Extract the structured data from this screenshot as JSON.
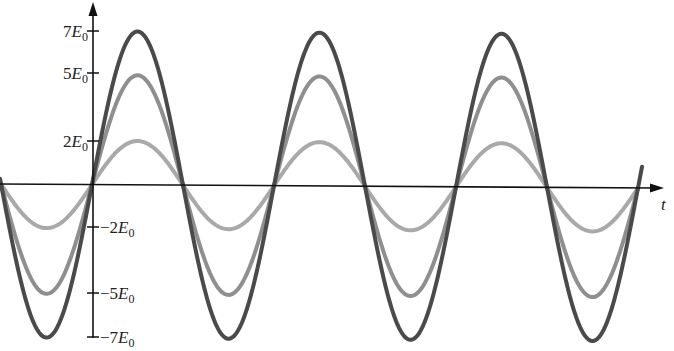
{
  "chart_data": {
    "type": "line",
    "title": "",
    "xlabel": "t",
    "ylabel": "",
    "ylim": [
      -7,
      7
    ],
    "grid": false,
    "legend": "none",
    "y_ticks": [
      {
        "value": 7,
        "label": "7E0"
      },
      {
        "value": 5,
        "label": "5E0"
      },
      {
        "value": 2,
        "label": "2E0"
      },
      {
        "value": -2,
        "label": "-2E0"
      },
      {
        "value": -5,
        "label": "-5E0"
      },
      {
        "value": -7,
        "label": "-7E0"
      }
    ],
    "x_range_periods": [
      -0.5,
      3.05
    ],
    "series": [
      {
        "name": "amplitude 7E0",
        "amplitude": 7,
        "color": "#4a4a4a",
        "function": "7 sin(t)"
      },
      {
        "name": "amplitude 5E0",
        "amplitude": 5,
        "color": "#8f8f8f",
        "function": "5 sin(t)"
      },
      {
        "name": "amplitude 2E0",
        "amplitude": 2,
        "color": "#a9a9a9",
        "function": "2 sin(t)"
      }
    ]
  },
  "labels": {
    "y7": "7",
    "y5": "5",
    "y2": "2",
    "yn2": "−2",
    "yn5": "−5",
    "yn7": "−7",
    "E": "E",
    "sub": "0",
    "t": "t"
  },
  "colors": {
    "axis": "#111111",
    "dark": "#4a4a4a",
    "mid": "#8f8f8f",
    "light": "#a9a9a9"
  }
}
